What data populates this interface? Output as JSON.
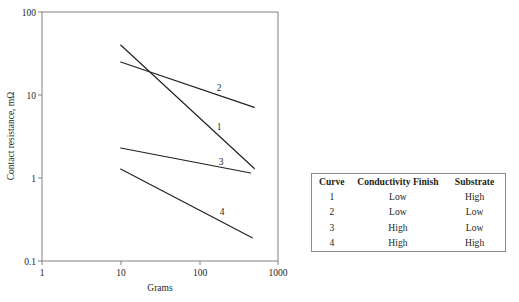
{
  "chart_data": {
    "type": "line",
    "title": "",
    "xlabel": "Grams",
    "ylabel": "Contact resistance, mΩ",
    "xscale": "log",
    "yscale": "log",
    "xlim": [
      1,
      1000
    ],
    "ylim": [
      0.1,
      100
    ],
    "xticks": [
      "1",
      "10",
      "100",
      "1000"
    ],
    "xtick_values": [
      1,
      10,
      100,
      1000
    ],
    "yticks": [
      "100",
      "10",
      "1",
      "0.1"
    ],
    "ytick_values": [
      100,
      10,
      1,
      0.1
    ],
    "grid": false,
    "legend_position": "table-right",
    "series": [
      {
        "name": "1",
        "label": "1",
        "x": [
          10,
          500
        ],
        "y": [
          40,
          1.3
        ]
      },
      {
        "name": "2",
        "label": "2",
        "x": [
          10,
          500
        ],
        "y": [
          25,
          7.1
        ]
      },
      {
        "name": "3",
        "label": "3",
        "x": [
          10,
          450
        ],
        "y": [
          2.3,
          1.15
        ]
      },
      {
        "name": "4",
        "label": "4",
        "x": [
          10,
          470
        ],
        "y": [
          1.28,
          0.19
        ]
      }
    ],
    "annotations": [
      {
        "text": "2",
        "x": 219,
        "y": 88
      },
      {
        "text": "1",
        "x": 219,
        "y": 127
      },
      {
        "text": "3",
        "x": 221,
        "y": 162
      },
      {
        "text": "4",
        "x": 222,
        "y": 212
      }
    ]
  },
  "axes": {
    "x_label": "Grams",
    "y_label": "Contact resistance, mΩ",
    "x_ticks": [
      "1",
      "10",
      "100",
      "1000"
    ],
    "y_ticks": [
      "100",
      "10",
      "1",
      "0.1"
    ]
  },
  "legend_table": {
    "headers": [
      "Curve",
      "Conductivity Finish",
      "Substrate"
    ],
    "rows": [
      {
        "curve": "1",
        "conductivity_finish": "Low",
        "substrate": "High"
      },
      {
        "curve": "2",
        "conductivity_finish": "Low",
        "substrate": "Low"
      },
      {
        "curve": "3",
        "conductivity_finish": "High",
        "substrate": "Low"
      },
      {
        "curve": "4",
        "conductivity_finish": "High",
        "substrate": "High"
      }
    ]
  },
  "colors": {
    "curve_stroke": "#231f20",
    "frame_stroke": "#808080",
    "table_border": "#8c8c8c",
    "text": "#231f20",
    "background": "#ffffff"
  }
}
